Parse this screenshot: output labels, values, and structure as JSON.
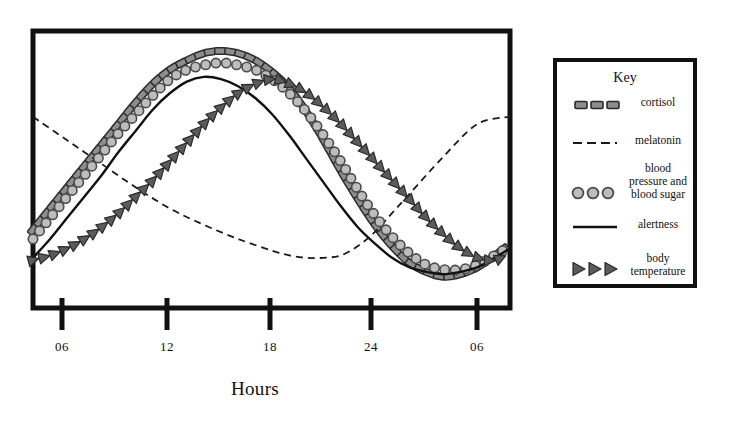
{
  "chart_data": {
    "type": "line",
    "title": "",
    "xlabel": "Hours",
    "ylabel": "",
    "grid": false,
    "legend_position": "right",
    "legend_title": "Key",
    "x_tick_labels": [
      "06",
      "12",
      "18",
      "24",
      "06"
    ],
    "x_tick_positions_hours": [
      6,
      12,
      18,
      24,
      30
    ],
    "xlim_hours": [
      4,
      31.9
    ],
    "ylim": [
      0,
      1
    ],
    "axis_note": "Relative level, unlabeled y-axis (circadian rhythm curves)",
    "series": [
      {
        "name": "cortisol",
        "marker": "dashed-square",
        "color": "#8d8d8d",
        "outline": "#2b2b2b",
        "x": [
          4.0,
          5.0,
          6.0,
          7.0,
          8.0,
          9.0,
          10.0,
          11.0,
          12.0,
          13.0,
          14.0,
          15.0,
          16.0,
          17.0,
          18.0,
          19.0,
          20.0,
          21.0,
          22.0,
          23.0,
          24.0,
          25.0,
          26.0,
          27.0,
          28.0,
          29.0,
          30.0,
          31.0,
          31.9
        ],
        "y": [
          0.24,
          0.33,
          0.42,
          0.51,
          0.6,
          0.69,
          0.78,
          0.86,
          0.92,
          0.96,
          0.99,
          1.0,
          0.99,
          0.96,
          0.91,
          0.84,
          0.74,
          0.62,
          0.49,
          0.37,
          0.26,
          0.17,
          0.1,
          0.06,
          0.04,
          0.05,
          0.08,
          0.13,
          0.18
        ]
      },
      {
        "name": "melatonin",
        "marker": "fine-dashed-line",
        "color": "#1a1a1a",
        "x": [
          4.0,
          6.0,
          8.0,
          10.0,
          12.0,
          14.0,
          16.0,
          18.0,
          19.0,
          20.0,
          21.0,
          22.0,
          23.0,
          24.0,
          25.0,
          26.0,
          28.0,
          30.0,
          31.9
        ],
        "y": [
          0.72,
          0.62,
          0.52,
          0.42,
          0.33,
          0.26,
          0.2,
          0.15,
          0.13,
          0.12,
          0.12,
          0.13,
          0.17,
          0.23,
          0.31,
          0.39,
          0.55,
          0.69,
          0.72
        ]
      },
      {
        "name": "blood pressure and blood sugar",
        "marker": "circle",
        "color": "#bdbdbd",
        "outline": "#4a4a4a",
        "x": [
          4.0,
          5.0,
          6.0,
          7.0,
          8.0,
          9.0,
          10.0,
          11.0,
          12.0,
          13.0,
          14.0,
          15.0,
          16.0,
          17.0,
          18.0,
          19.0,
          20.0,
          21.0,
          22.0,
          23.0,
          24.0,
          25.0,
          26.0,
          27.0,
          28.0,
          29.0,
          30.0,
          31.0,
          31.9
        ],
        "y": [
          0.2,
          0.29,
          0.38,
          0.47,
          0.56,
          0.65,
          0.73,
          0.81,
          0.88,
          0.92,
          0.94,
          0.95,
          0.94,
          0.92,
          0.88,
          0.82,
          0.74,
          0.64,
          0.53,
          0.41,
          0.3,
          0.21,
          0.14,
          0.09,
          0.07,
          0.07,
          0.09,
          0.13,
          0.17
        ]
      },
      {
        "name": "alertness",
        "marker": "solid-line",
        "color": "#111111",
        "x": [
          4.0,
          5.0,
          6.0,
          7.0,
          8.0,
          9.0,
          10.0,
          11.0,
          12.0,
          13.0,
          14.0,
          15.0,
          16.0,
          17.0,
          18.0,
          19.0,
          20.0,
          21.0,
          22.0,
          23.0,
          24.0,
          25.0,
          26.0,
          27.0,
          28.0,
          29.0,
          30.0,
          31.0,
          31.9
        ],
        "y": [
          0.12,
          0.2,
          0.29,
          0.38,
          0.47,
          0.57,
          0.66,
          0.75,
          0.82,
          0.87,
          0.89,
          0.88,
          0.85,
          0.8,
          0.73,
          0.64,
          0.54,
          0.44,
          0.34,
          0.25,
          0.18,
          0.12,
          0.08,
          0.06,
          0.05,
          0.06,
          0.08,
          0.12,
          0.16
        ]
      },
      {
        "name": "body temperature",
        "marker": "triangle",
        "color": "#5b5b5b",
        "outline": "#2b2b2b",
        "x": [
          4.0,
          5.0,
          6.0,
          7.0,
          8.0,
          9.0,
          10.0,
          11.0,
          12.0,
          13.0,
          14.0,
          15.0,
          16.0,
          17.0,
          18.0,
          19.0,
          20.0,
          21.0,
          22.0,
          23.0,
          24.0,
          25.0,
          26.0,
          27.0,
          28.0,
          29.0,
          30.0,
          31.0,
          31.9
        ],
        "y": [
          0.11,
          0.13,
          0.16,
          0.2,
          0.25,
          0.31,
          0.38,
          0.45,
          0.53,
          0.61,
          0.69,
          0.76,
          0.82,
          0.86,
          0.88,
          0.86,
          0.82,
          0.76,
          0.69,
          0.61,
          0.53,
          0.45,
          0.37,
          0.29,
          0.22,
          0.16,
          0.12,
          0.11,
          0.14
        ]
      }
    ]
  },
  "axis": {
    "x_title": "Hours",
    "ticks": [
      {
        "label": "06",
        "px": 62
      },
      {
        "label": "12",
        "px": 167
      },
      {
        "label": "18",
        "px": 270
      },
      {
        "label": "24",
        "px": 371
      },
      {
        "label": "06",
        "px": 477
      }
    ]
  },
  "legend": {
    "title": "Key",
    "items": [
      {
        "label": "cortisol",
        "marker": "dashed-square"
      },
      {
        "label": "melatonin",
        "marker": "fine-dashed-line"
      },
      {
        "label": "blood\npressure and\nblood sugar",
        "marker": "circle"
      },
      {
        "label": "alertness",
        "marker": "solid-line"
      },
      {
        "label": "body\ntemperature",
        "marker": "triangle"
      }
    ]
  },
  "colors": {
    "frame": "#111111",
    "cortisol_fill": "#8d8d8d",
    "cortisol_outline": "#2b2b2b",
    "circle_fill": "#bdbdbd",
    "circle_outline": "#4a4a4a",
    "triangle_fill": "#5b5b5b",
    "triangle_outline": "#2b2b2b",
    "alertness": "#111111",
    "melatonin": "#1a1a1a",
    "background": "#ffffff"
  }
}
